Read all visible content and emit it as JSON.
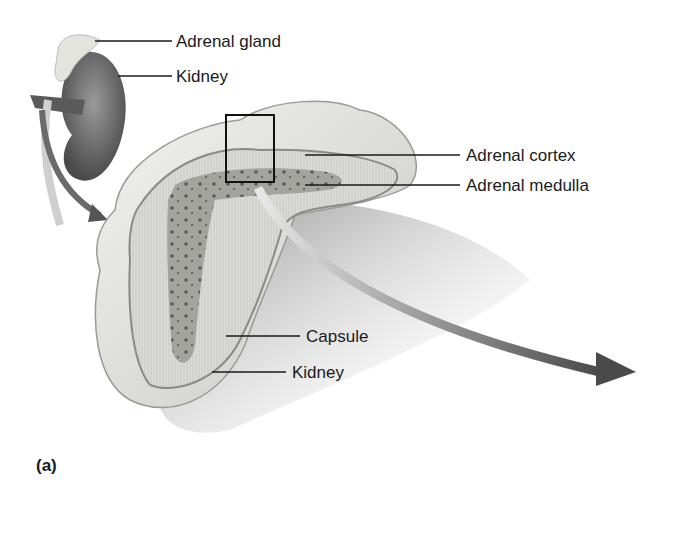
{
  "figure": {
    "panel_label": "(a)",
    "labels": {
      "adrenal_gland": "Adrenal gland",
      "kidney_top": "Kidney",
      "adrenal_cortex": "Adrenal cortex",
      "adrenal_medulla": "Adrenal medulla",
      "capsule": "Capsule",
      "kidney_bottom": "Kidney"
    },
    "colors": {
      "background": "#ffffff",
      "leader_line": "#1a1a1a",
      "cortex": "#d8d8d4",
      "medulla": "#a8a8a2",
      "gland_surface": "#e6e6e2",
      "kidney_shade": "#6e6e6e",
      "arrow": "#555555"
    }
  }
}
